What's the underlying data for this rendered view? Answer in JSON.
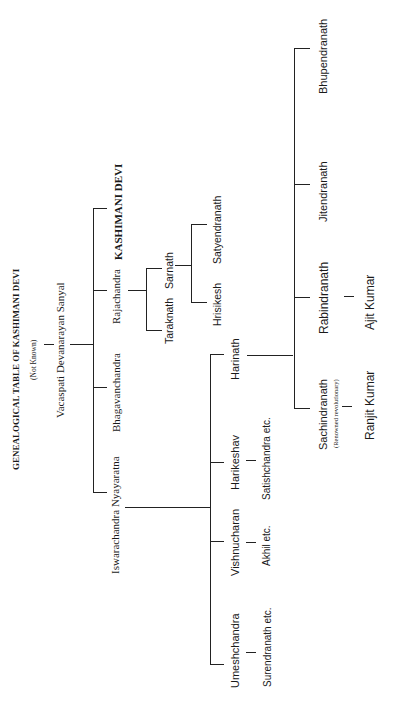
{
  "title": "GENEALOGICAL TABLE OF KASHIMANI DEVI",
  "root_note": "(Not Known)",
  "generation1": {
    "name": "Vacaspati Devanarayan Sanyal"
  },
  "generation2": [
    {
      "name": "Iswarachandra Nyayaratna"
    },
    {
      "name": "Bhagavanchandra"
    },
    {
      "name": "Rajachandra"
    },
    {
      "name": "KASHIMANI DEVI"
    }
  ],
  "rajachandra_children": [
    {
      "name": "Taraknath"
    },
    {
      "name": "Sarnath"
    }
  ],
  "sarnath_children": [
    {
      "name": "Hrisikesh"
    },
    {
      "name": "Satyendranath"
    }
  ],
  "iswarachandra_children": [
    {
      "name": "Umeshchandra",
      "child": "Surendranath etc."
    },
    {
      "name": "Vishnucharan",
      "child": "Akhil etc."
    },
    {
      "name": "Harikeshav",
      "child": "Satishchandra etc."
    },
    {
      "name": "Harinath"
    }
  ],
  "harinath_children": [
    {
      "name": "Sachindranath",
      "note": "(Renowned revolutionary)",
      "child": "Ranjit Kumar"
    },
    {
      "name": "Rabindranath",
      "child": "Ajit Kumar"
    },
    {
      "name": "Jitendranath"
    },
    {
      "name": "Bhupendranath"
    }
  ]
}
